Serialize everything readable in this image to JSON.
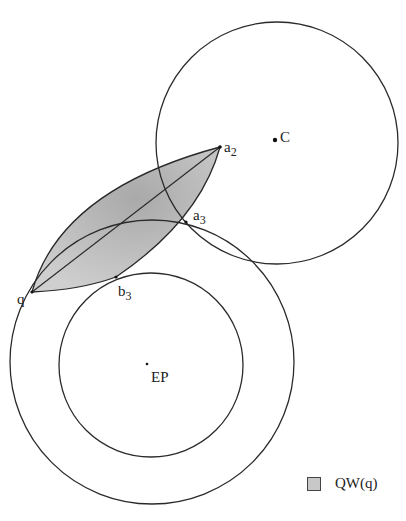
{
  "diagram": {
    "points": {
      "C": {
        "label": "C",
        "x": 275,
        "y": 140
      },
      "EP": {
        "label": "EP",
        "x": 147,
        "y": 364
      },
      "q": {
        "label": "q",
        "x": 32,
        "y": 292
      },
      "a2": {
        "label": "a",
        "sub": "2",
        "x": 220,
        "y": 147
      },
      "a3": {
        "label": "a",
        "sub": "3",
        "x": 186,
        "y": 222
      },
      "b3": {
        "label": "b",
        "sub": "3",
        "x": 116,
        "y": 277
      }
    },
    "circles": {
      "upper": {
        "cx": 277,
        "cy": 143,
        "r": 121
      },
      "outer": {
        "cx": 152,
        "cy": 362,
        "r": 142
      },
      "inner": {
        "cx": 151,
        "cy": 365,
        "r": 92
      }
    },
    "legend": {
      "label": "QW(q)",
      "fill": "#c8c8c8"
    },
    "colors": {
      "stroke": "#2a2a2a",
      "region_fill": "#c4c4c4"
    }
  }
}
